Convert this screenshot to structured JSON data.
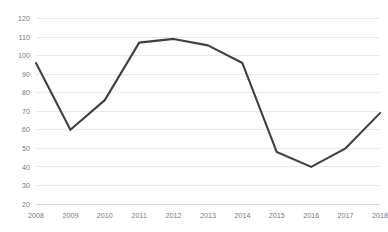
{
  "chart_data": {
    "type": "line",
    "title": "",
    "subtitle": "",
    "xlabel": "",
    "ylabel": "",
    "categories": [
      "2008",
      "2009",
      "2010",
      "2011",
      "2012",
      "2013",
      "2014",
      "2015",
      "2016",
      "2017",
      "2018"
    ],
    "series": [
      {
        "name": "Series 1",
        "color": "#404040",
        "values": [
          96,
          60,
          76,
          107,
          109,
          105.5,
          96,
          48,
          40,
          50,
          69
        ]
      }
    ],
    "ylim": [
      20,
      120
    ],
    "ytick_step": 10,
    "ytick_labels": [
      "120",
      "110",
      "100",
      "90",
      "80",
      "70",
      "60",
      "50",
      "40",
      "30",
      "20"
    ],
    "ytick_values": [
      120,
      110,
      100,
      90,
      80,
      70,
      60,
      50,
      40,
      30,
      20
    ],
    "xtick_labels": [
      "2008",
      "2009",
      "2010",
      "2011",
      "2012",
      "2013",
      "2014",
      "2015",
      "2016",
      "2017",
      "2018"
    ],
    "grid": true,
    "grid_axis": "y",
    "legend": false,
    "legend_position": "none",
    "markers": false,
    "annotations": []
  },
  "colors": {
    "line": "#404040",
    "gridline": "#e2e2e2",
    "axis": "#d0d0d0",
    "tick_text": "#7a7a7a",
    "background": "#ffffff"
  },
  "plot": {
    "left": 36,
    "right": 380,
    "top": 18.5,
    "bottom": 204
  }
}
